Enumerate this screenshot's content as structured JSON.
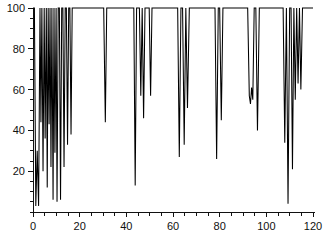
{
  "chart_data": {
    "type": "line",
    "title": "",
    "subtitle": "",
    "xlabel": "",
    "ylabel": "",
    "xlim": [
      0,
      120
    ],
    "ylim": [
      0,
      100
    ],
    "grid": false,
    "legend": null,
    "legend_position": "none",
    "x_ticks_major": [
      0,
      20,
      40,
      60,
      80,
      100,
      120
    ],
    "x_tick_labels": [
      "0",
      "20",
      "40",
      "60",
      "80",
      "100",
      "120"
    ],
    "x_tick_minor_step": 5,
    "y_ticks_major": [
      20,
      40,
      60,
      80,
      100
    ],
    "y_tick_labels": [
      "20",
      "40",
      "60",
      "80",
      "100"
    ],
    "y_tick_minor_step": 5,
    "series": [
      {
        "name": "series-1",
        "color": "#000000",
        "x": [
          0,
          0.6,
          1.2,
          1.8,
          2.4,
          3.0,
          3.4,
          3.8,
          4.3,
          4.8,
          5.2,
          5.7,
          6.1,
          6.5,
          6.9,
          7.3,
          7.7,
          8.1,
          8.6,
          9.0,
          9.4,
          9.9,
          10.3,
          10.8,
          11.3,
          11.8,
          12.3,
          12.8,
          13.3,
          13.8,
          14.3,
          14.8,
          15.3,
          15.8,
          16.3,
          16.8,
          17.3,
          18.0,
          19.0,
          20.0,
          25.0,
          29.5,
          30.3,
          31.0,
          31.6,
          32.3,
          33.0,
          36.0,
          40.0,
          42.5,
          43.2,
          43.8,
          44.4,
          45.0,
          45.6,
          46.2,
          46.8,
          47.4,
          48.0,
          48.6,
          49.2,
          49.8,
          50.4,
          51.0,
          52.0,
          55.0,
          60.0,
          62.0,
          62.7,
          63.4,
          64.1,
          64.8,
          65.5,
          66.2,
          67.0,
          70.0,
          75.0,
          78.0,
          78.7,
          79.4,
          80.0,
          80.7,
          81.4,
          82.0,
          85.0,
          90.0,
          92.0,
          92.7,
          93.2,
          93.7,
          94.2,
          94.8,
          95.5,
          96.2,
          97.0,
          100.0,
          104.0,
          106.5,
          107.2,
          107.9,
          108.6,
          109.3,
          110.0,
          110.6,
          111.2,
          111.8,
          112.4,
          113.0,
          113.6,
          114.2,
          114.8,
          115.5,
          116.5,
          118.0,
          120.0
        ],
        "y": [
          100,
          100,
          3,
          30,
          3,
          100,
          44,
          100,
          20,
          100,
          36,
          100,
          12,
          100,
          43,
          100,
          22,
          100,
          6,
          100,
          29,
          100,
          5,
          100,
          100,
          6,
          100,
          100,
          22,
          100,
          100,
          33,
          100,
          100,
          38,
          100,
          100,
          100,
          100,
          100,
          100,
          100,
          100,
          44,
          100,
          100,
          100,
          100,
          100,
          100,
          100,
          13,
          100,
          100,
          100,
          57,
          100,
          46,
          100,
          100,
          100,
          100,
          57,
          100,
          100,
          100,
          100,
          100,
          27,
          100,
          100,
          33,
          100,
          51,
          100,
          100,
          100,
          100,
          26,
          100,
          100,
          45,
          100,
          100,
          100,
          100,
          100,
          57,
          53,
          61,
          55,
          100,
          100,
          40,
          100,
          100,
          100,
          100,
          100,
          34,
          100,
          4,
          100,
          100,
          21,
          100,
          55,
          100,
          63,
          100,
          60,
          100,
          100,
          100,
          100
        ]
      }
    ]
  },
  "axes": {
    "x_axis_name": "x-axis",
    "y_axis_name": "y-axis"
  }
}
